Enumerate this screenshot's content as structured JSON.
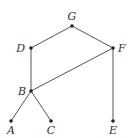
{
  "diagram": {
    "type": "hasse-diagram",
    "nodes": [
      {
        "id": "G",
        "label": "G",
        "x": 72,
        "y": 26,
        "lx": 72,
        "ly": 20,
        "anchor": "middle"
      },
      {
        "id": "D",
        "label": "D",
        "x": 31,
        "y": 48,
        "lx": 25,
        "ly": 52,
        "anchor": "end"
      },
      {
        "id": "F",
        "label": "F",
        "x": 113,
        "y": 48,
        "lx": 118,
        "ly": 52,
        "anchor": "start"
      },
      {
        "id": "B",
        "label": "B",
        "x": 31,
        "y": 91,
        "lx": 26,
        "ly": 95,
        "anchor": "end"
      },
      {
        "id": "A",
        "label": "A",
        "x": 11,
        "y": 121,
        "lx": 11,
        "ly": 134,
        "anchor": "middle"
      },
      {
        "id": "C",
        "label": "C",
        "x": 51,
        "y": 121,
        "lx": 51,
        "ly": 134,
        "anchor": "middle"
      },
      {
        "id": "E",
        "label": "E",
        "x": 113,
        "y": 121,
        "lx": 113,
        "ly": 134,
        "anchor": "middle"
      }
    ],
    "edges": [
      [
        "G",
        "D"
      ],
      [
        "G",
        "F"
      ],
      [
        "D",
        "B"
      ],
      [
        "F",
        "B"
      ],
      [
        "F",
        "E"
      ],
      [
        "B",
        "A"
      ],
      [
        "B",
        "C"
      ]
    ]
  }
}
